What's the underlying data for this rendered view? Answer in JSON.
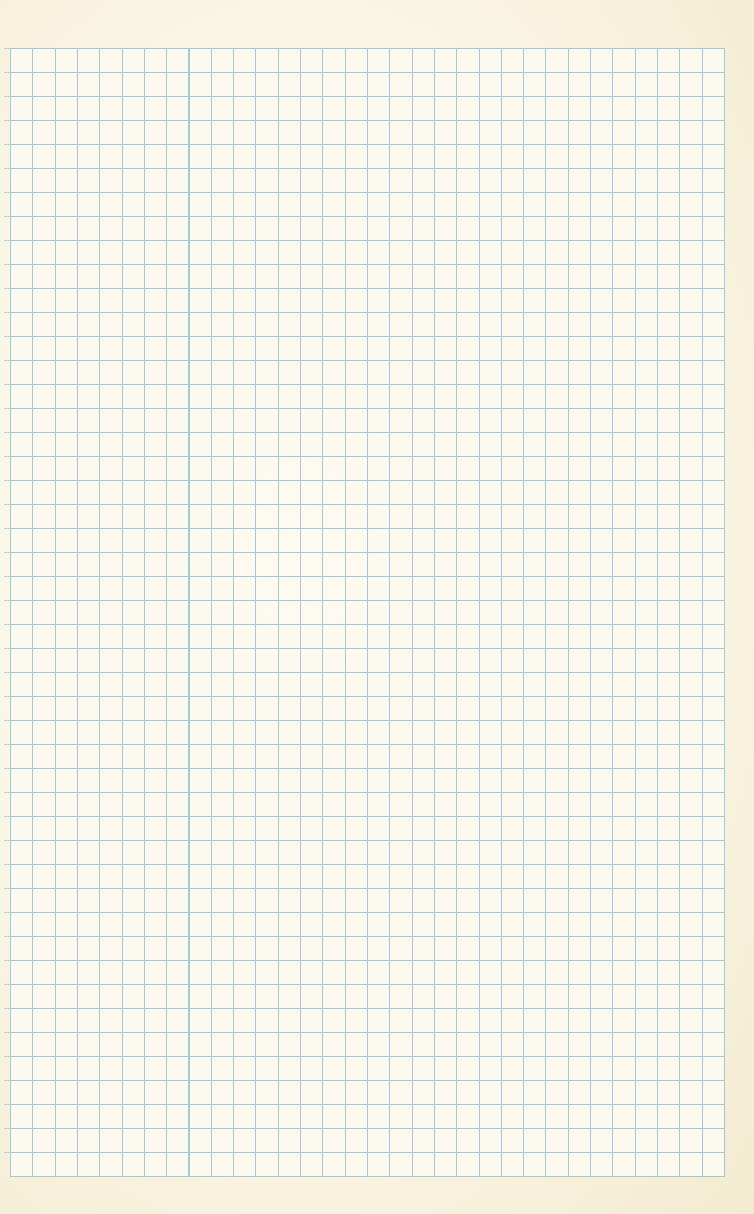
{
  "sheet": {
    "type": "graph-paper",
    "label": "Blank graph paper",
    "grid": {
      "columns": 32,
      "rows": 47,
      "line_color": "#9fc7d6",
      "paper_color": "#f8f2dc"
    }
  }
}
